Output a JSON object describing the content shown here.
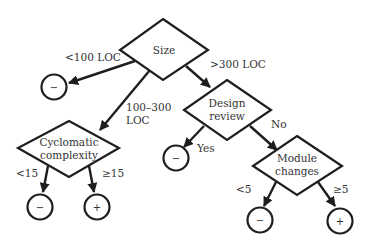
{
  "diagram": {
    "type": "decision-tree",
    "colors": {
      "stroke": "#1e1e1e",
      "text": "#333333",
      "background": "#ffffff"
    },
    "nodes": {
      "size": {
        "label_lines": [
          "Size"
        ]
      },
      "cyclomatic": {
        "label_lines": [
          "Cyclomatic",
          "complexity"
        ]
      },
      "design_review": {
        "label_lines": [
          "Design",
          "review"
        ]
      },
      "module_changes": {
        "label_lines": [
          "Module",
          "changes"
        ]
      },
      "leaf_small": {
        "label": "−"
      },
      "leaf_cc_low": {
        "label": "−"
      },
      "leaf_cc_high": {
        "label": "+"
      },
      "leaf_review_yes": {
        "label": "−"
      },
      "leaf_mc_low": {
        "label": "−"
      },
      "leaf_mc_high": {
        "label": "+"
      }
    },
    "edges": {
      "size_small": {
        "label": "<100 LOC"
      },
      "size_medium": {
        "label_lines": [
          "100–300",
          "LOC"
        ]
      },
      "size_large": {
        "label": ">300 LOC"
      },
      "cc_low": {
        "label": "<15"
      },
      "cc_high": {
        "label": "≥15"
      },
      "review_yes": {
        "label": "Yes"
      },
      "review_no": {
        "label": "No"
      },
      "mc_low": {
        "label": "<5"
      },
      "mc_high": {
        "label": "≥5"
      }
    }
  }
}
